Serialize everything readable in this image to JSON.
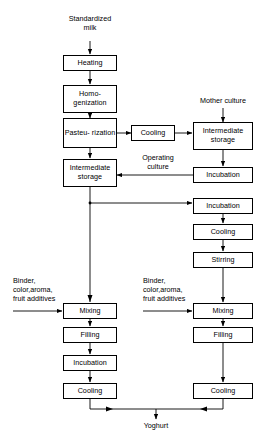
{
  "diagram": {
    "type": "process-flowchart",
    "line_color": "#000000",
    "box_fill": "#ffffff",
    "width": 261,
    "height": 441,
    "inputs": [
      {
        "id": "standardized-milk",
        "label": "Standardized\nmilk"
      },
      {
        "id": "mother-culture",
        "label": "Mother culture"
      },
      {
        "id": "binder-left",
        "label": "Binder,\ncolor,aroma,\nfruit additives"
      },
      {
        "id": "binder-right",
        "label": "Binder,\ncolor,aroma,\nfruit additives"
      }
    ],
    "edge_labels": [
      {
        "id": "operating-culture",
        "label": "Operating\nculture"
      }
    ],
    "output": {
      "id": "yoghurt",
      "label": "Yoghurt"
    },
    "nodes": [
      {
        "id": "heating",
        "label": "Heating"
      },
      {
        "id": "homogenization",
        "label": "Homo-\ngenization"
      },
      {
        "id": "pasteurization",
        "label": "Pasteu-\nrization"
      },
      {
        "id": "cooling-top",
        "label": "Cooling"
      },
      {
        "id": "intermediate-storage-right",
        "label": "Intermediate\nstorage"
      },
      {
        "id": "intermediate-storage-left",
        "label": "Intermediate\nstorage"
      },
      {
        "id": "incubation-culture",
        "label": "Incubation"
      },
      {
        "id": "incubation-stirred",
        "label": "Incubation"
      },
      {
        "id": "cooling-stirred",
        "label": "Cooling"
      },
      {
        "id": "stirring",
        "label": "Stirring"
      },
      {
        "id": "mixing-left",
        "label": "Mixing"
      },
      {
        "id": "mixing-right",
        "label": "Mixing"
      },
      {
        "id": "filling-left",
        "label": "Filling"
      },
      {
        "id": "filling-right",
        "label": "Filling"
      },
      {
        "id": "incubation-set",
        "label": "Incubation"
      },
      {
        "id": "cooling-set",
        "label": "Cooling"
      },
      {
        "id": "cooling-right-final",
        "label": "Cooling"
      }
    ]
  }
}
